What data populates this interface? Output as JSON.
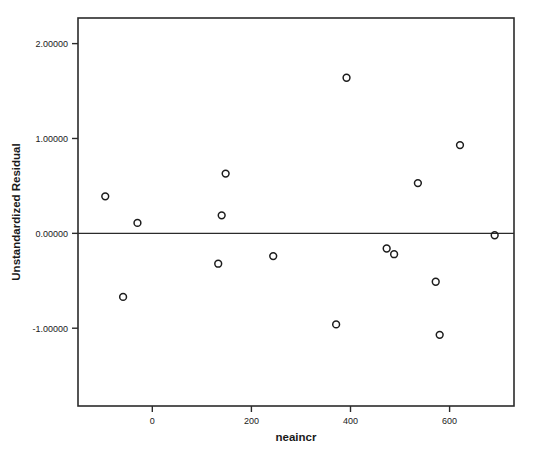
{
  "chart_data": {
    "type": "scatter",
    "title": "",
    "xlabel": "neaincr",
    "ylabel": "Unstandardized Residual",
    "xlim": [
      -150,
      730
    ],
    "ylim": [
      -1.82,
      2.27
    ],
    "xticks": [
      0,
      200,
      400,
      600
    ],
    "xticklabels": [
      "0",
      "200",
      "400",
      "600"
    ],
    "yticks": [
      -1.0,
      0.0,
      1.0,
      2.0
    ],
    "yticklabels": [
      "-1.00000",
      "0.00000",
      "1.00000",
      "2.00000"
    ],
    "grid": false,
    "legend": false,
    "reference_line": {
      "orientation": "horizontal",
      "value": 0.0
    },
    "marker": {
      "shape": "circle-open",
      "radius": 3.4,
      "color": "#1c1c1c"
    },
    "points": [
      {
        "x": -95,
        "y": 0.39
      },
      {
        "x": -59,
        "y": -0.67
      },
      {
        "x": -30,
        "y": 0.11
      },
      {
        "x": 133,
        "y": -0.32
      },
      {
        "x": 140,
        "y": 0.19
      },
      {
        "x": 148,
        "y": 0.63
      },
      {
        "x": 244,
        "y": -0.24
      },
      {
        "x": 371,
        "y": -0.96
      },
      {
        "x": 392,
        "y": 1.64
      },
      {
        "x": 473,
        "y": -0.16
      },
      {
        "x": 488,
        "y": -0.22
      },
      {
        "x": 536,
        "y": 0.53
      },
      {
        "x": 572,
        "y": -0.51
      },
      {
        "x": 580,
        "y": -1.07
      },
      {
        "x": 621,
        "y": 0.93
      },
      {
        "x": 691,
        "y": -0.02
      }
    ]
  },
  "colors": {
    "background": "#ffffff",
    "axis": "#2b2b2b",
    "marker": "#1c1c1c",
    "text": "#1a1a1a"
  }
}
